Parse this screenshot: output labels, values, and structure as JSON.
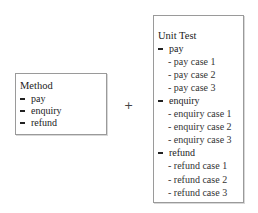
{
  "method_box": {
    "title": "Method",
    "items": [
      "pay",
      "enquiry",
      "refund"
    ]
  },
  "operator": "+",
  "unit_test_box": {
    "title": "Unit Test",
    "groups": [
      {
        "label": "pay",
        "cases": [
          "- pay case 1",
          "- pay case 2",
          "- pay case 3"
        ]
      },
      {
        "label": "enquiry",
        "cases": [
          "- enquiry case 1",
          "- enquiry case 2",
          "- enquiry case 3"
        ]
      },
      {
        "label": "refund",
        "cases": [
          "- refund case 1",
          "- refund case 2",
          "- refund case 3"
        ]
      }
    ]
  }
}
